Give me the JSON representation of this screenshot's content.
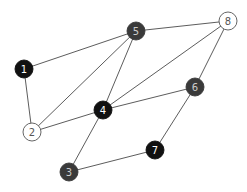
{
  "graph": {
    "nodes": [
      {
        "id": "1",
        "label": "1",
        "x": 24,
        "y": 69,
        "fill": "#111111",
        "text": "#ffffff"
      },
      {
        "id": "2",
        "label": "2",
        "x": 32,
        "y": 132,
        "fill": "#ffffff",
        "text": "#555555"
      },
      {
        "id": "3",
        "label": "3",
        "x": 69,
        "y": 172,
        "fill": "#3a3a3a",
        "text": "#cccccc"
      },
      {
        "id": "4",
        "label": "4",
        "x": 103,
        "y": 110,
        "fill": "#111111",
        "text": "#ffffff"
      },
      {
        "id": "5",
        "label": "5",
        "x": 136,
        "y": 31,
        "fill": "#3a3a3a",
        "text": "#cccccc"
      },
      {
        "id": "6",
        "label": "6",
        "x": 195,
        "y": 87,
        "fill": "#3a3a3a",
        "text": "#cccccc"
      },
      {
        "id": "7",
        "label": "7",
        "x": 155,
        "y": 150,
        "fill": "#111111",
        "text": "#ffffff"
      },
      {
        "id": "8",
        "label": "8",
        "x": 228,
        "y": 21,
        "fill": "#ffffff",
        "text": "#555555"
      }
    ],
    "edges": [
      [
        "1",
        "5"
      ],
      [
        "1",
        "2"
      ],
      [
        "2",
        "5"
      ],
      [
        "2",
        "4"
      ],
      [
        "4",
        "5"
      ],
      [
        "4",
        "8"
      ],
      [
        "4",
        "6"
      ],
      [
        "4",
        "3"
      ],
      [
        "3",
        "7"
      ],
      [
        "7",
        "6"
      ],
      [
        "6",
        "8"
      ],
      [
        "5",
        "8"
      ]
    ],
    "node_radius": 9
  }
}
